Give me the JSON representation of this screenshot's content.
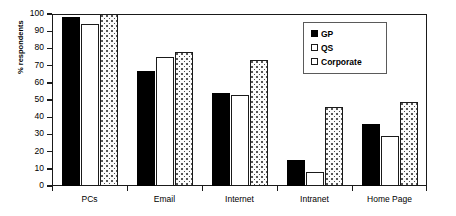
{
  "chart_data": {
    "type": "bar",
    "title": "",
    "xlabel": "",
    "ylabel": "% respondents",
    "ylim": [
      0,
      100
    ],
    "yticks": [
      0,
      10,
      20,
      30,
      40,
      50,
      60,
      70,
      80,
      90,
      100
    ],
    "grid": false,
    "legend_position": "top-right",
    "categories": [
      "PCs",
      "Email",
      "Internet",
      "Intranet",
      "Home Page"
    ],
    "series": [
      {
        "name": "GP",
        "values": [
          98,
          67,
          54,
          15,
          36
        ],
        "fill": "solid-black",
        "color": "#000000"
      },
      {
        "name": "QS",
        "values": [
          94,
          75,
          53,
          8,
          29
        ],
        "fill": "open-white",
        "color": "#ffffff"
      },
      {
        "name": "Corporate",
        "values": [
          100,
          78,
          73,
          46,
          49
        ],
        "fill": "dotted-stipple",
        "color": "#fbfbfb"
      }
    ]
  },
  "legend": {
    "entries": [
      {
        "label": "GP"
      },
      {
        "label": "QS"
      },
      {
        "label": "Corporate"
      }
    ]
  },
  "axis": {
    "y_title": "% respondents",
    "y_tick_labels": [
      "100",
      "90",
      "80",
      "70",
      "60",
      "50",
      "40",
      "30",
      "20",
      "10",
      "0"
    ],
    "x_tick_labels": [
      "PCs",
      "Email",
      "Internet",
      "Intranet",
      "Home Page"
    ]
  }
}
